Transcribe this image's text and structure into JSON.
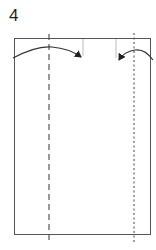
{
  "diagram": {
    "step_label": "4",
    "colors": {
      "outline": "#555555",
      "fold_lines": "#444444",
      "arrows": "#333333",
      "guide_marks": "#999999"
    },
    "elements": [
      {
        "type": "rectangle",
        "name": "paper-sheet"
      },
      {
        "type": "dashed-line",
        "name": "valley-fold-line-left"
      },
      {
        "type": "dotted-line",
        "name": "mountain-fold-line-right"
      },
      {
        "type": "guide-mark",
        "name": "guide-mark-left"
      },
      {
        "type": "guide-mark",
        "name": "guide-mark-right"
      },
      {
        "type": "curved-arrow",
        "name": "fold-arrow-left",
        "direction": "right"
      },
      {
        "type": "curved-arrow",
        "name": "fold-arrow-right",
        "direction": "left"
      }
    ]
  }
}
